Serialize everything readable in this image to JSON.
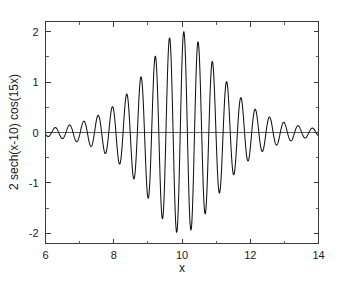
{
  "chart_data": {
    "type": "line",
    "title": "",
    "subtitle": "",
    "xlabel": "x",
    "ylabel": "2 sech(x-10) cos(15x)",
    "xlim": [
      6,
      14
    ],
    "ylim": [
      -2.2,
      2.2
    ],
    "grid": false,
    "legend": null,
    "legend_position": "none",
    "background_color": "#ffffff",
    "line_color": "#111111",
    "axis_color": "#3a3a3a",
    "frame": "box",
    "tick_direction": "in",
    "zero_line": true,
    "xticks": [
      6,
      8,
      10,
      12,
      14
    ],
    "xtick_labels": [
      "6",
      "8",
      "10",
      "12",
      "14"
    ],
    "xticks_minor": [
      7,
      9,
      11,
      13
    ],
    "yticks": [
      -2,
      -1,
      0,
      1,
      2
    ],
    "ytick_labels": [
      "-2",
      "-1",
      "0",
      "1",
      "2"
    ],
    "yticks_minor": [
      -1.5,
      -0.5,
      0.5,
      1.5
    ],
    "annotations": [],
    "series": [
      {
        "name": "2 sech(x-10) cos(15x)",
        "formula": "y = 2 * sech(x - 10) * cos(15 * x)",
        "envelope_formula": "2 * sech(x - 10)",
        "amplitude": 2,
        "frequency": 15,
        "center": 10,
        "samples": 3200,
        "peak_value": 1.98,
        "peak_x": 10.05,
        "min_value": -1.95,
        "min_x": 9.84,
        "x_start": 6,
        "x_end": 14
      }
    ]
  },
  "caption": {
    "text": ""
  }
}
